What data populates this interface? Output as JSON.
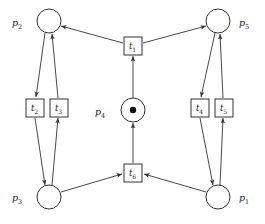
{
  "diagram": {
    "type": "petri-net",
    "title": "",
    "background_color": "#ffffff",
    "stroke_color": "#333333",
    "token_color": "#111111"
  },
  "places": [
    {
      "id": "p2",
      "name": "p",
      "index": "2",
      "label": "p2",
      "cx": 49,
      "cy": 21,
      "r": 12,
      "tokens": 0,
      "label_x": 12,
      "label_y": 26
    },
    {
      "id": "p5",
      "name": "p",
      "index": "5",
      "label": "p5",
      "cx": 218,
      "cy": 21,
      "r": 12,
      "tokens": 0,
      "label_x": 239,
      "label_y": 26
    },
    {
      "id": "p4",
      "name": "p",
      "index": "4",
      "label": "p4",
      "cx": 133,
      "cy": 110,
      "r": 12,
      "tokens": 1,
      "label_x": 95,
      "label_y": 115
    },
    {
      "id": "p3",
      "name": "p",
      "index": "3",
      "label": "p3",
      "cx": 49,
      "cy": 197,
      "r": 12,
      "tokens": 0,
      "label_x": 12,
      "label_y": 201
    },
    {
      "id": "p1",
      "name": "p",
      "index": "1",
      "label": "p1",
      "cx": 218,
      "cy": 197,
      "r": 12,
      "tokens": 0,
      "label_x": 239,
      "label_y": 201
    }
  ],
  "transitions": [
    {
      "id": "t1",
      "name": "t",
      "index": "1",
      "label": "t1",
      "x": 124,
      "y": 37,
      "w": 18,
      "h": 18
    },
    {
      "id": "t2",
      "name": "t",
      "index": "2",
      "label": "t2",
      "x": 26,
      "y": 99,
      "w": 18,
      "h": 18
    },
    {
      "id": "t3",
      "name": "t",
      "index": "3",
      "label": "t3",
      "x": 50,
      "y": 99,
      "w": 18,
      "h": 18
    },
    {
      "id": "t4",
      "name": "t",
      "index": "4",
      "label": "t4",
      "x": 191,
      "y": 99,
      "w": 18,
      "h": 18
    },
    {
      "id": "t5",
      "name": "t",
      "index": "5",
      "label": "t5",
      "x": 215,
      "y": 99,
      "w": 18,
      "h": 18
    },
    {
      "id": "t6",
      "name": "t",
      "index": "6",
      "label": "t6",
      "x": 124,
      "y": 164,
      "w": 18,
      "h": 18
    }
  ],
  "arcs": [
    {
      "id": "arc-t1-p2",
      "from": "t1",
      "to": "p2",
      "x1": 123,
      "y1": 43,
      "x2": 61,
      "y2": 26
    },
    {
      "id": "arc-t1-p5",
      "from": "t1",
      "to": "p5",
      "x1": 143,
      "y1": 43,
      "x2": 206,
      "y2": 26
    },
    {
      "id": "arc-p4-t1",
      "from": "p4",
      "to": "t1",
      "x1": 133,
      "y1": 98,
      "x2": 133,
      "y2": 56
    },
    {
      "id": "arc-t6-p4",
      "from": "t6",
      "to": "p4",
      "x1": 133,
      "y1": 163,
      "x2": 133,
      "y2": 123
    },
    {
      "id": "arc-p2-t2",
      "from": "p2",
      "to": "t2",
      "x1": 45,
      "y1": 33,
      "x2": 36,
      "y2": 97
    },
    {
      "id": "arc-t3-p2",
      "from": "t3",
      "to": "p2",
      "x1": 58,
      "y1": 98,
      "x2": 52,
      "y2": 34
    },
    {
      "id": "arc-t2-p3",
      "from": "t2",
      "to": "p3",
      "x1": 35,
      "y1": 118,
      "x2": 45,
      "y2": 185
    },
    {
      "id": "arc-p3-t3",
      "from": "p3",
      "to": "t3",
      "x1": 52,
      "y1": 185,
      "x2": 58,
      "y2": 118
    },
    {
      "id": "arc-p5-t4",
      "from": "p5",
      "to": "t4",
      "x1": 215,
      "y1": 33,
      "x2": 201,
      "y2": 97
    },
    {
      "id": "arc-t5-p5",
      "from": "t5",
      "to": "p5",
      "x1": 223,
      "y1": 98,
      "x2": 220,
      "y2": 34
    },
    {
      "id": "arc-t4-p3",
      "from": "t4",
      "to": "p1",
      "x1": 200,
      "y1": 118,
      "x2": 213,
      "y2": 185
    },
    {
      "id": "arc-p1-t5",
      "from": "p1",
      "to": "t5",
      "x1": 220,
      "y1": 185,
      "x2": 223,
      "y2": 118
    },
    {
      "id": "arc-p3-t6",
      "from": "p3",
      "to": "t6",
      "x1": 61,
      "y1": 192,
      "x2": 122,
      "y2": 174
    },
    {
      "id": "arc-p1-t6",
      "from": "p1",
      "to": "t6",
      "x1": 206,
      "y1": 192,
      "x2": 144,
      "y2": 174
    }
  ]
}
